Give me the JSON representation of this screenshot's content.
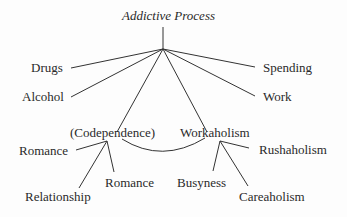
{
  "diagram": {
    "title": "Addictive Process",
    "branches": {
      "drugs": "Drugs",
      "alcohol": "Alcohol",
      "spending": "Spending",
      "work": "Work",
      "codependence": "(Codependence)",
      "workaholism": "Workaholism"
    },
    "codependence_children": {
      "romance_left": "Romance",
      "relationship": "Relationship",
      "romance": "Romance"
    },
    "workaholism_children": {
      "busyness": "Busyness",
      "careaholism": "Careaholism",
      "rushaholism": "Rushaholism"
    },
    "colors": {
      "ink": "#2a2a2a",
      "background": "#fdfdfd"
    }
  }
}
